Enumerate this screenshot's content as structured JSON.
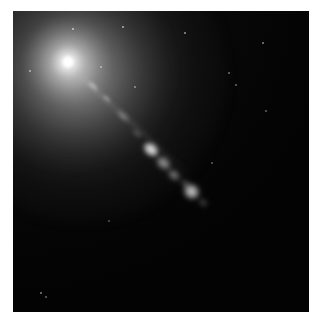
{
  "image": {
    "type": "astronomical-photograph",
    "subject": "elliptical galaxy with relativistic jet",
    "frame": {
      "left": 13,
      "top": 11,
      "width": 296,
      "height": 301,
      "background_color": "#000000",
      "page_background_color": "#ffffff"
    },
    "features": {
      "nucleus": {
        "name": "galaxy-nucleus",
        "center_x": 55,
        "center_y": 51,
        "color": "#ffffff",
        "description": "bright unresolved core"
      },
      "halo": {
        "name": "galaxy-halo",
        "description": "diffuse grey starlight envelope brightest toward upper-left",
        "color": "#8c8c8c"
      },
      "jet": {
        "name": "relativistic-jet",
        "position_angle_deg": 42,
        "description": "narrow linear jet extending from nucleus toward lower-right"
      }
    },
    "knots": [
      {
        "label": "knot-1",
        "x": 80,
        "y": 75,
        "w": 14,
        "h": 6,
        "angle": 42,
        "brightness": 0.42,
        "blur": 1.6
      },
      {
        "label": "knot-2",
        "x": 93,
        "y": 87,
        "w": 11,
        "h": 5,
        "angle": 42,
        "brightness": 0.34,
        "blur": 1.6
      },
      {
        "label": "knot-3",
        "x": 110,
        "y": 105,
        "w": 16,
        "h": 6,
        "angle": 42,
        "brightness": 0.4,
        "blur": 2.0
      },
      {
        "label": "knot-4",
        "x": 124,
        "y": 122,
        "w": 12,
        "h": 5,
        "angle": 42,
        "brightness": 0.3,
        "blur": 2.0
      },
      {
        "label": "knot-a-bright",
        "x": 138,
        "y": 138,
        "w": 18,
        "h": 13,
        "angle": 40,
        "brightness": 0.98,
        "blur": 2.2
      },
      {
        "label": "knot-b",
        "x": 150,
        "y": 152,
        "w": 17,
        "h": 12,
        "angle": 40,
        "brightness": 0.62,
        "blur": 2.4
      },
      {
        "label": "knot-c",
        "x": 161,
        "y": 164,
        "w": 14,
        "h": 10,
        "angle": 40,
        "brightness": 0.5,
        "blur": 2.4
      },
      {
        "label": "knot-d",
        "x": 172,
        "y": 172,
        "w": 10,
        "h": 7,
        "angle": 40,
        "brightness": 0.34,
        "blur": 2.4
      },
      {
        "label": "knot-e-lower",
        "x": 178,
        "y": 180,
        "w": 17,
        "h": 15,
        "angle": 40,
        "brightness": 0.86,
        "blur": 2.4
      },
      {
        "label": "knot-f-tail",
        "x": 190,
        "y": 191,
        "w": 10,
        "h": 7,
        "angle": 40,
        "brightness": 0.3,
        "blur": 2.4
      }
    ],
    "stars": [
      {
        "label": "star-1",
        "x": 60,
        "y": 18,
        "size": 2.0,
        "brightness": 0.75
      },
      {
        "label": "star-2",
        "x": 110,
        "y": 16,
        "size": 1.8,
        "brightness": 0.65
      },
      {
        "label": "star-3",
        "x": 172,
        "y": 22,
        "size": 1.6,
        "brightness": 0.55
      },
      {
        "label": "star-4",
        "x": 250,
        "y": 32,
        "size": 1.6,
        "brightness": 0.5
      },
      {
        "label": "star-5",
        "x": 17,
        "y": 60,
        "size": 1.8,
        "brightness": 0.6
      },
      {
        "label": "star-6",
        "x": 88,
        "y": 56,
        "size": 1.5,
        "brightness": 0.5
      },
      {
        "label": "star-7",
        "x": 122,
        "y": 76,
        "size": 1.5,
        "brightness": 0.45
      },
      {
        "label": "star-8",
        "x": 216,
        "y": 62,
        "size": 1.8,
        "brightness": 0.45
      },
      {
        "label": "star-9",
        "x": 223,
        "y": 74,
        "size": 1.5,
        "brightness": 0.4
      },
      {
        "label": "star-10",
        "x": 253,
        "y": 100,
        "size": 1.5,
        "brightness": 0.38
      },
      {
        "label": "star-11",
        "x": 28,
        "y": 282,
        "size": 2.0,
        "brightness": 0.55
      },
      {
        "label": "star-12",
        "x": 33,
        "y": 286,
        "size": 1.5,
        "brightness": 0.4
      },
      {
        "label": "star-13",
        "x": 199,
        "y": 152,
        "size": 1.4,
        "brightness": 0.35
      },
      {
        "label": "star-14",
        "x": 96,
        "y": 210,
        "size": 1.3,
        "brightness": 0.3
      }
    ]
  }
}
